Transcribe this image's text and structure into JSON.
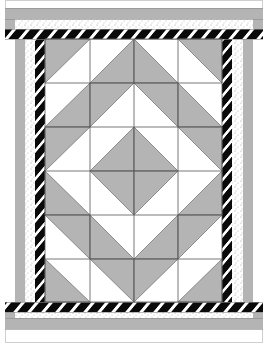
{
  "quilt": {
    "width": 269,
    "height": 347,
    "colors": {
      "background": "#ffffff",
      "gray": "#b4b4b4",
      "black": "#0a0a0a",
      "white": "#ffffff",
      "dot": "#9a9a9a",
      "line": "#555555",
      "outline": "#6a6a6a"
    },
    "borders": {
      "outer_white": {
        "top": [
          0,
          8
        ],
        "bottom": [
          329,
          347
        ],
        "left": [
          5,
          15
        ],
        "right": [
          253,
          263
        ]
      },
      "gray": {
        "top": [
          8,
          19
        ],
        "bottom": [
          318,
          329
        ],
        "left": [
          15,
          25
        ],
        "right": [
          243,
          253
        ]
      },
      "dotted": {
        "top": [
          19,
          29
        ],
        "bottom": [
          308,
          318
        ],
        "left": [
          25,
          35
        ],
        "right": [
          233,
          243
        ]
      },
      "stripe": {
        "top": [
          29,
          39
        ],
        "bottom": [
          302,
          312
        ],
        "left": [
          35,
          45
        ],
        "right": [
          222,
          232
        ]
      }
    },
    "grid": {
      "x0": 45,
      "y0": 39,
      "cols": [
        45,
        90,
        134,
        178,
        222
      ],
      "rows": [
        39,
        83,
        127,
        171,
        215,
        259,
        302
      ],
      "blocks": [
        [
          "tl",
          "br",
          "bl",
          "tr"
        ],
        [
          "br",
          "tl",
          "tr",
          "bl"
        ],
        [
          "tl",
          "br",
          "bl",
          "tr"
        ],
        [
          "bl",
          "tr",
          "tl",
          "br"
        ],
        [
          "tr",
          "bl",
          "br",
          "tl"
        ],
        [
          "bl",
          "tr",
          "tl",
          "br"
        ]
      ]
    }
  }
}
